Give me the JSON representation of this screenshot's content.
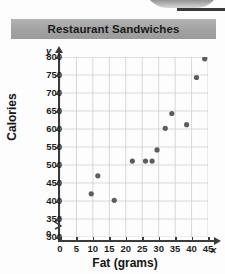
{
  "title": "Restaurant Sandwiches",
  "axis_var_y": "y",
  "axis_var_x": "x",
  "origin_label": "0",
  "chart_data": {
    "type": "scatter",
    "title": "Restaurant Sandwiches",
    "xlabel": "Fat (grams)",
    "ylabel": "Calories",
    "xlim": [
      0,
      45
    ],
    "ylim": [
      300,
      800
    ],
    "y_axis_break": true,
    "grid": true,
    "legend": "none",
    "xticks": [
      "0",
      "5",
      "10",
      "15",
      "20",
      "25",
      "30",
      "35",
      "40",
      "45"
    ],
    "yticks": [
      "300",
      "350",
      "400",
      "450",
      "500",
      "550",
      "600",
      "650",
      "700",
      "750",
      "800"
    ],
    "points": [
      {
        "x": 9.5,
        "y": 420
      },
      {
        "x": 11.5,
        "y": 470
      },
      {
        "x": 16.5,
        "y": 402
      },
      {
        "x": 22,
        "y": 511
      },
      {
        "x": 26,
        "y": 511
      },
      {
        "x": 28,
        "y": 511
      },
      {
        "x": 29.5,
        "y": 542
      },
      {
        "x": 32,
        "y": 602
      },
      {
        "x": 34,
        "y": 643
      },
      {
        "x": 38.5,
        "y": 612
      },
      {
        "x": 41.5,
        "y": 743
      },
      {
        "x": 44,
        "y": 795
      }
    ],
    "marker_color": "#5d5d5d"
  }
}
